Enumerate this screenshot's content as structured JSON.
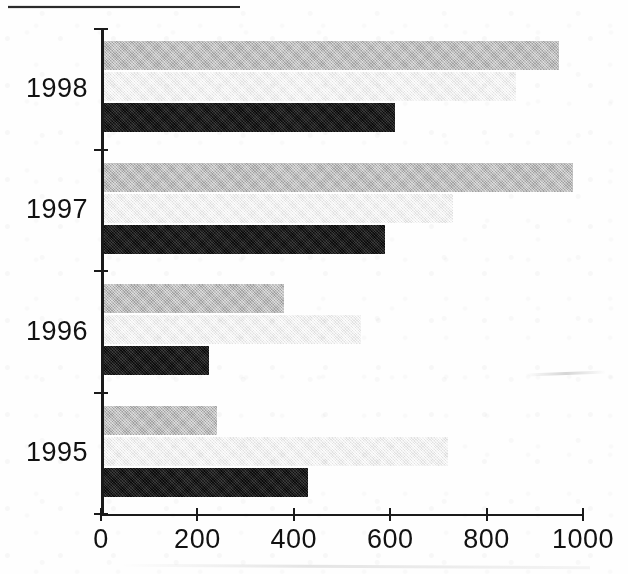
{
  "chart_data": {
    "type": "bar",
    "orientation": "horizontal",
    "title": "",
    "subtitle": "",
    "xlabel": "",
    "ylabel": "",
    "categories": [
      "1995",
      "1996",
      "1997",
      "1998"
    ],
    "xlim": [
      0,
      1000
    ],
    "ylim": null,
    "grid": false,
    "legend_position": "none",
    "x_ticks": [
      {
        "value": 0,
        "label": "0"
      },
      {
        "value": 200,
        "label": "200"
      },
      {
        "value": 400,
        "label": "400"
      },
      {
        "value": 600,
        "label": "600"
      },
      {
        "value": 800,
        "label": "800"
      },
      {
        "value": 1000,
        "label": "1000"
      }
    ],
    "series": [
      {
        "name": "series-1",
        "color": "#b4b4b4",
        "swatch_description": "medium gray",
        "values": [
          240,
          380,
          980,
          950
        ]
      },
      {
        "name": "series-2",
        "color": "#f1f1f1",
        "swatch_description": "very light gray",
        "values": [
          720,
          540,
          730,
          860
        ]
      },
      {
        "name": "series-3",
        "color": "#121212",
        "swatch_description": "black",
        "values": [
          430,
          225,
          590,
          610
        ]
      }
    ],
    "annotations": []
  },
  "axes": {
    "x_tick_labels": [
      "0",
      "200",
      "400",
      "600",
      "800",
      "1000"
    ],
    "y_tick_labels": [
      "1998",
      "1997",
      "1996",
      "1995"
    ]
  }
}
